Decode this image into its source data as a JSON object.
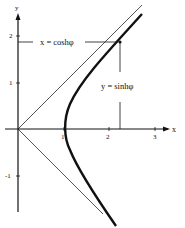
{
  "diagram": {
    "type": "hyperbola-parametrization",
    "axes": {
      "x_label": "x",
      "y_label": "y",
      "x_ticks": [
        "1",
        "2",
        "3"
      ],
      "y_ticks": [
        "2",
        "1",
        "-1"
      ]
    },
    "annotations": {
      "x_eq": "x = coshφ",
      "y_eq": "y = sinhφ"
    },
    "curve": "x² − y² = 1 (right branch)",
    "asymptotes": [
      "y = x",
      "y = −x"
    ],
    "point": {
      "x": 2.2,
      "y": 1.95
    },
    "colors": {
      "ink": "#111111",
      "asymptote": "#444444"
    }
  }
}
